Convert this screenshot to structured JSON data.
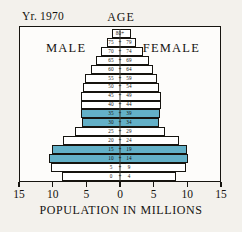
{
  "header": {
    "year_prefix": "Y",
    "year_prefix_small": "r.",
    "year_label": "Yr. 1970",
    "year_value": "1970",
    "age_label": "AGE",
    "male_label": "MALE",
    "female_label": "FEMALE"
  },
  "axis": {
    "title": "POPULATION IN MILLIONS",
    "ticks": [
      "15",
      "10",
      "5",
      "0",
      "5",
      "10",
      "15"
    ]
  },
  "chart_data": {
    "type": "bar",
    "title": "Yr. 1970",
    "subtitle": "AGE",
    "xlabel": "POPULATION IN MILLIONS",
    "ylabel": "AGE",
    "orientation": "horizontal",
    "layout": "population-pyramid",
    "xlim": [
      -15,
      15
    ],
    "xticks": [
      15,
      10,
      5,
      0,
      5,
      10,
      15
    ],
    "grid": false,
    "legend": "none",
    "highlight_color": "#63b0c7",
    "bar_color": "#ffffff",
    "outline_color": "#16140f",
    "categories": [
      "0 - 4",
      "5 - 9",
      "10 - 14",
      "15 - 19",
      "20 - 24",
      "25 - 29",
      "30 - 34",
      "35 - 39",
      "40 - 44",
      "45 - 49",
      "50 - 54",
      "55 - 59",
      "60 - 64",
      "65 - 69",
      "70 - 74",
      "75 - 79",
      "80+"
    ],
    "age_tick_glyph": "+",
    "series": [
      {
        "name": "MALE",
        "side": "left",
        "values": [
          8.7,
          10.3,
          10.6,
          10.2,
          8.5,
          6.7,
          5.7,
          5.8,
          5.9,
          5.9,
          5.6,
          5.2,
          4.4,
          3.6,
          2.9,
          1.9,
          1.2
        ]
      },
      {
        "name": "FEMALE",
        "side": "right",
        "values": [
          8.4,
          9.9,
          10.2,
          10.0,
          8.8,
          6.8,
          5.8,
          6.0,
          6.1,
          6.1,
          5.9,
          5.6,
          5.0,
          4.3,
          3.5,
          2.4,
          1.7
        ]
      }
    ],
    "highlighted_categories": [
      "10 - 14",
      "15 - 19",
      "30 - 34",
      "35 - 39"
    ],
    "rows": [
      {
        "label_left": "80+",
        "label_right": "",
        "single": true,
        "male": 1.2,
        "female": 1.7,
        "highlight": false
      },
      {
        "label_left": "75",
        "label_right": "79",
        "single": false,
        "male": 1.9,
        "female": 2.4,
        "highlight": false
      },
      {
        "label_left": "70",
        "label_right": "74",
        "single": false,
        "male": 2.9,
        "female": 3.5,
        "highlight": false
      },
      {
        "label_left": "65",
        "label_right": "69",
        "single": false,
        "male": 3.6,
        "female": 4.3,
        "highlight": false
      },
      {
        "label_left": "60",
        "label_right": "64",
        "single": false,
        "male": 4.4,
        "female": 5.0,
        "highlight": false
      },
      {
        "label_left": "55",
        "label_right": "59",
        "single": false,
        "male": 5.2,
        "female": 5.6,
        "highlight": false
      },
      {
        "label_left": "50",
        "label_right": "54",
        "single": false,
        "male": 5.6,
        "female": 5.9,
        "highlight": false
      },
      {
        "label_left": "45",
        "label_right": "49",
        "single": false,
        "male": 5.9,
        "female": 6.1,
        "highlight": false
      },
      {
        "label_left": "40",
        "label_right": "44",
        "single": false,
        "male": 5.9,
        "female": 6.1,
        "highlight": false
      },
      {
        "label_left": "35",
        "label_right": "39",
        "single": false,
        "male": 5.8,
        "female": 6.0,
        "highlight": true
      },
      {
        "label_left": "30",
        "label_right": "34",
        "single": false,
        "male": 5.7,
        "female": 5.8,
        "highlight": true
      },
      {
        "label_left": "25",
        "label_right": "29",
        "single": false,
        "male": 6.7,
        "female": 6.8,
        "highlight": false
      },
      {
        "label_left": "20",
        "label_right": "24",
        "single": false,
        "male": 8.5,
        "female": 8.8,
        "highlight": false
      },
      {
        "label_left": "15",
        "label_right": "19",
        "single": false,
        "male": 10.2,
        "female": 10.0,
        "highlight": true
      },
      {
        "label_left": "10",
        "label_right": "14",
        "single": false,
        "male": 10.6,
        "female": 10.2,
        "highlight": true
      },
      {
        "label_left": "5",
        "label_right": "9",
        "single": false,
        "male": 10.3,
        "female": 9.9,
        "highlight": false
      },
      {
        "label_left": "0",
        "label_right": "4",
        "single": false,
        "male": 8.7,
        "female": 8.4,
        "highlight": false
      }
    ]
  }
}
